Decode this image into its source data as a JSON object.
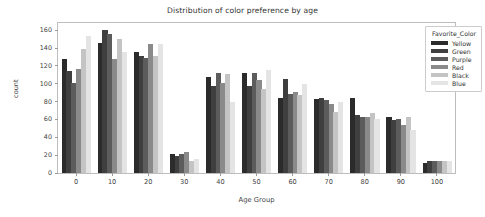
{
  "chart_data": {
    "type": "bar",
    "title": "Distribution of color preference by age",
    "xlabel": "Age Group",
    "ylabel": "count",
    "categories": [
      "0",
      "10",
      "20",
      "30",
      "40",
      "50",
      "60",
      "70",
      "80",
      "90",
      "100"
    ],
    "ylim": [
      0,
      168
    ],
    "yticks": [
      0,
      20,
      40,
      60,
      80,
      100,
      120,
      140,
      160
    ],
    "grid": false,
    "legend_position": "upper right",
    "legend_title": "Favorite_Color",
    "series": [
      {
        "name": "Yellow",
        "color": "#2b2b2b",
        "values": [
          128,
          146,
          136,
          21,
          107,
          112,
          84,
          83,
          84,
          63,
          11
        ]
      },
      {
        "name": "Green",
        "color": "#3f3f3f",
        "values": [
          114,
          160,
          131,
          19,
          98,
          97,
          105,
          84,
          65,
          59,
          14
        ]
      },
      {
        "name": "Purple",
        "color": "#5c5c5c",
        "values": [
          101,
          156,
          129,
          21,
          112,
          112,
          89,
          82,
          63,
          60,
          13
        ]
      },
      {
        "name": "Red",
        "color": "#8a8a8a",
        "values": [
          117,
          128,
          145,
          24,
          101,
          104,
          91,
          77,
          63,
          54,
          13
        ]
      },
      {
        "name": "Black",
        "color": "#c4c4c4",
        "values": [
          139,
          150,
          131,
          14,
          111,
          94,
          87,
          68,
          67,
          63,
          14
        ]
      },
      {
        "name": "Blue",
        "color": "#e4e4e4",
        "values": [
          154,
          136,
          145,
          16,
          79,
          115,
          100,
          79,
          61,
          48,
          13
        ]
      }
    ]
  }
}
